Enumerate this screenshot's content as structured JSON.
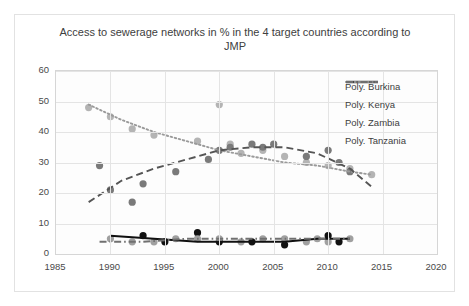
{
  "chart_data": {
    "type": "scatter",
    "title": "Access to sewerage networks in % in the 4 target countries according to JMP",
    "xlabel": "",
    "ylabel": "",
    "xlim": [
      1985,
      2020
    ],
    "ylim": [
      0,
      60
    ],
    "xticks": [
      1985,
      1990,
      1995,
      2000,
      2005,
      2010,
      2015,
      2020
    ],
    "yticks": [
      0,
      10,
      20,
      30,
      40,
      50,
      60
    ],
    "grid": true,
    "legend_position": "top-right",
    "legend": [
      {
        "label": "Poly. Burkina",
        "style": "solid",
        "color": "#1a1a1a"
      },
      {
        "label": "Poly. Kenya",
        "style": "dashed",
        "color": "#4a4a4a"
      },
      {
        "label": "Poly. Zambia",
        "style": "dotted",
        "color": "#8c8c8c"
      },
      {
        "label": "Poly. Tanzania",
        "style": "dashdot",
        "color": "#6e6e6e"
      }
    ],
    "series": [
      {
        "name": "Zambia",
        "marker_color": "#b4b4b4",
        "points": [
          [
            1988,
            48
          ],
          [
            1990,
            45
          ],
          [
            1992,
            41
          ],
          [
            1994,
            39
          ],
          [
            1998,
            37
          ],
          [
            2000,
            49
          ],
          [
            2001,
            36
          ],
          [
            2002,
            33
          ],
          [
            2004,
            34
          ],
          [
            2006,
            32
          ],
          [
            2008,
            30
          ],
          [
            2010,
            29
          ],
          [
            2012,
            28
          ],
          [
            2014,
            26
          ]
        ]
      },
      {
        "name": "Kenya",
        "marker_color": "#7a7a7a",
        "points": [
          [
            1989,
            29
          ],
          [
            1990,
            21
          ],
          [
            1992,
            17
          ],
          [
            1993,
            23
          ],
          [
            1996,
            27
          ],
          [
            1999,
            31
          ],
          [
            2000,
            34
          ],
          [
            2001,
            35
          ],
          [
            2003,
            36
          ],
          [
            2004,
            35
          ],
          [
            2005,
            36
          ],
          [
            2008,
            32
          ],
          [
            2010,
            34
          ],
          [
            2011,
            30
          ],
          [
            2012,
            27
          ]
        ]
      },
      {
        "name": "Burkina",
        "marker_color": "#111111",
        "points": [
          [
            1993,
            6
          ],
          [
            1995,
            4
          ],
          [
            1998,
            7
          ],
          [
            2000,
            4
          ],
          [
            2003,
            4
          ],
          [
            2006,
            3
          ],
          [
            2010,
            6
          ],
          [
            2011,
            4
          ]
        ]
      },
      {
        "name": "Tanzania",
        "marker_color": "#a0a0a0",
        "points": [
          [
            1990,
            5
          ],
          [
            1992,
            4
          ],
          [
            1994,
            4
          ],
          [
            1996,
            5
          ],
          [
            1998,
            5
          ],
          [
            2000,
            5
          ],
          [
            2002,
            4
          ],
          [
            2004,
            5
          ],
          [
            2006,
            5
          ],
          [
            2008,
            4
          ],
          [
            2009,
            5
          ],
          [
            2010,
            4
          ],
          [
            2012,
            5
          ]
        ]
      }
    ],
    "trendlines": [
      {
        "name": "Poly. Zambia",
        "style": "dotted",
        "color": "#9a9a9a",
        "points": [
          [
            1988,
            49
          ],
          [
            1991,
            44
          ],
          [
            1994,
            40
          ],
          [
            1997,
            37
          ],
          [
            2000,
            34
          ],
          [
            2003,
            32
          ],
          [
            2006,
            30
          ],
          [
            2009,
            29
          ],
          [
            2012,
            27
          ],
          [
            2014,
            26
          ]
        ]
      },
      {
        "name": "Poly. Kenya",
        "style": "dashed",
        "color": "#555555",
        "points": [
          [
            1988,
            17
          ],
          [
            1991,
            24
          ],
          [
            1994,
            28
          ],
          [
            1997,
            31
          ],
          [
            2000,
            34
          ],
          [
            2003,
            35
          ],
          [
            2006,
            35
          ],
          [
            2009,
            33
          ],
          [
            2012,
            28
          ],
          [
            2014,
            22
          ]
        ]
      },
      {
        "name": "Poly. Burkina",
        "style": "solid",
        "color": "#101010",
        "points": [
          [
            1990,
            6
          ],
          [
            1994,
            5
          ],
          [
            1998,
            4
          ],
          [
            2002,
            4
          ],
          [
            2006,
            4
          ],
          [
            2009,
            5
          ],
          [
            2012,
            5
          ]
        ]
      },
      {
        "name": "Poly. Tanzania",
        "style": "dashdot",
        "color": "#707070",
        "points": [
          [
            1989,
            4
          ],
          [
            1993,
            4
          ],
          [
            1997,
            5
          ],
          [
            2001,
            5
          ],
          [
            2005,
            5
          ],
          [
            2009,
            5
          ],
          [
            2012,
            5
          ]
        ]
      }
    ]
  }
}
